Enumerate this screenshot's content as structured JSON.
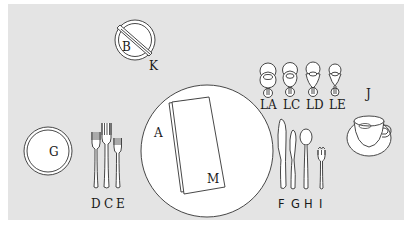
{
  "diagram": {
    "background_color": "#e4e4e4",
    "labels": {
      "bread_plate": "B",
      "butter_knife": "K",
      "dinner_plate": "A",
      "napkin": "M",
      "salad_plate": "G",
      "forks": "D C E",
      "fork_d": "D",
      "fork_c": "C",
      "fork_e": "E",
      "knife_f": "F",
      "knife_g": "G",
      "spoon_h": "H",
      "oyster_fork_i": "I",
      "glass_la": "LA",
      "glass_lc": "LC",
      "glass_ld": "LD",
      "glass_le": "LE",
      "cup_saucer": "J"
    }
  }
}
